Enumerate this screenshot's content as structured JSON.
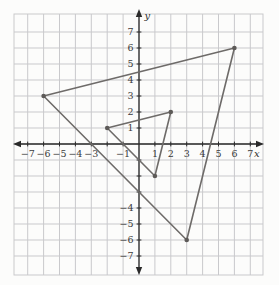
{
  "figure": {
    "width": 279,
    "height": 285,
    "background": "#fcfcfb",
    "colors": {
      "grid": "#c9c9cc",
      "axis": "#2a2a2a",
      "tick_label": "#3b3b3b",
      "shape": "#6e6b69",
      "vertex_dot": "#5d5a58"
    }
  },
  "chart_data": {
    "type": "line",
    "title": "",
    "subtitle": "",
    "xlabel": "x",
    "ylabel": "y",
    "xlim": [
      -7.9,
      7.8
    ],
    "ylim": [
      -8.2,
      8.2
    ],
    "grid": true,
    "legend": "none",
    "x_ticks": [
      -7,
      -6,
      -5,
      -4,
      -3,
      -2,
      -1,
      1,
      2,
      3,
      4,
      5,
      6,
      7
    ],
    "y_ticks": [
      -7,
      -6,
      -5,
      -4,
      -3,
      -2,
      -1,
      1,
      2,
      3,
      4,
      5,
      6,
      7
    ],
    "x_tick_labels_visible": [
      -7,
      -6,
      -5,
      -4,
      -3,
      -1,
      1,
      2,
      3,
      4,
      5,
      6,
      7
    ],
    "y_tick_labels_visible": [
      -7,
      -6,
      -5,
      -4,
      1,
      2,
      3,
      4,
      5,
      6,
      7
    ],
    "series": [
      {
        "name": "large-triangle",
        "closed": true,
        "vertices": [
          [
            -6,
            3
          ],
          [
            6,
            6
          ],
          [
            3,
            -6
          ]
        ]
      },
      {
        "name": "small-triangle",
        "closed": true,
        "vertices": [
          [
            -2,
            1
          ],
          [
            2,
            2
          ],
          [
            1,
            -2
          ]
        ]
      }
    ]
  }
}
